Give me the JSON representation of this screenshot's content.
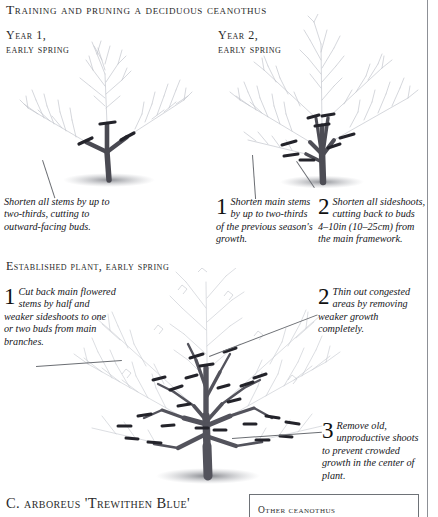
{
  "page": {
    "title": "Training and pruning a deciduous ceanothus",
    "species_name": "C. arboreus 'Trewithen Blue'"
  },
  "sections": [
    {
      "id": "year1",
      "heading": "Year 1,\nearly spring"
    },
    {
      "id": "year2",
      "heading": "Year 2,\nearly spring"
    },
    {
      "id": "established",
      "heading": "Established plant, early spring"
    }
  ],
  "headings": {
    "year1_line1": "Year 1,",
    "year1_line2": "early spring",
    "year2_line1": "Year 2,",
    "year2_line2": "early spring",
    "established": "Established plant, early spring"
  },
  "captions": {
    "year1": {
      "number": "",
      "text": "Shorten all stems by up to two-thirds, cutting to outward-facing buds."
    },
    "year2_step1": {
      "number": "1",
      "text": "Shorten main stems by up to two-thirds of the previous season's growth."
    },
    "year2_step2": {
      "number": "2",
      "text": "Shorten all sideshoots, cutting back to buds 4–10in (10–25cm) from the main framework."
    },
    "established_step1": {
      "number": "1",
      "text": "Cut back main flowered stems by half and weaker sideshoots to one or two buds from main branches."
    },
    "established_step2": {
      "number": "2",
      "text": "Thin out congested areas by removing weaker growth completely."
    },
    "established_step3": {
      "number": "3",
      "text": "Remove old, unproductive shoots to prevent crowded growth in the center of plant."
    }
  },
  "panel": {
    "heading": "Other ceanothus"
  },
  "colors": {
    "ink": "#1a1a1a",
    "rule": "#8d9096",
    "branch_dark": "#4a4a52",
    "branch_light": "#b9bcc4",
    "ground_shadow": "#9a9ca2"
  },
  "icons": {
    "vertical_rule": "column-divider",
    "panel_box": "sidebar-panel-box"
  }
}
